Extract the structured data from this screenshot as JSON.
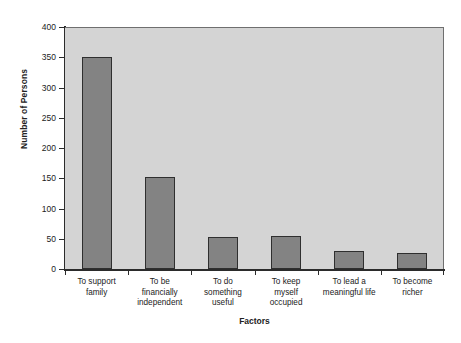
{
  "chart_data": {
    "type": "bar",
    "title": "",
    "xlabel": "Factors",
    "ylabel": "Number of Persons",
    "categories": [
      "To support family",
      "To be financially independent",
      "To do something useful",
      "To keep myself occupied",
      "To lead a meaningful life",
      "To become richer"
    ],
    "category_lines": [
      [
        "To support",
        "family"
      ],
      [
        "To be",
        "financially",
        "independent"
      ],
      [
        "To do",
        "something",
        "useful"
      ],
      [
        "To keep",
        "myself",
        "occupied"
      ],
      [
        "To lead a",
        "meaningful life"
      ],
      [
        "To become",
        "richer"
      ]
    ],
    "values": [
      350,
      152,
      53,
      54,
      30,
      27
    ],
    "ylim": [
      0,
      400
    ],
    "ytick_values": [
      0,
      50,
      100,
      150,
      200,
      250,
      300,
      350,
      400
    ],
    "ytick_labels": [
      "0",
      "50",
      "100",
      "150",
      "200",
      "250",
      "300",
      "350",
      "400"
    ],
    "grid": false,
    "legend": null,
    "colors": {
      "bar_fill": "#838383",
      "bar_edge": "#2f2f2f",
      "plot_background": "#d4d4d4",
      "page_background": "#ffffff",
      "axis": "#2b2b2b",
      "text": "#222222"
    }
  }
}
